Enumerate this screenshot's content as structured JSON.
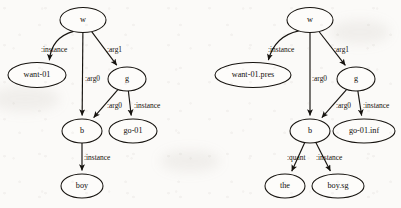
{
  "figure": {
    "type": "amr-graph-pair",
    "background_color": "#fbfaf8",
    "stroke_color": "#16130f",
    "node_fill": "#fdfcfa"
  },
  "graphs": [
    {
      "id": "left-graph",
      "name": "amr-graph-left",
      "nodes": [
        {
          "id": "w",
          "label": "w",
          "cx": 83,
          "cy": 20,
          "rx": 23,
          "ry": 12.5,
          "font_size": 8.2
        },
        {
          "id": "want",
          "label": "want-01",
          "cx": 37,
          "cy": 75,
          "rx": 29,
          "ry": 12.5,
          "font_size": 8.2
        },
        {
          "id": "g",
          "label": "g",
          "cx": 127,
          "cy": 79,
          "rx": 19,
          "ry": 12.0,
          "font_size": 8.2
        },
        {
          "id": "b",
          "label": "b",
          "cx": 82,
          "cy": 131,
          "rx": 20,
          "ry": 12.0,
          "font_size": 8.2
        },
        {
          "id": "go",
          "label": "go-01",
          "cx": 133,
          "cy": 131,
          "rx": 24,
          "ry": 12.0,
          "font_size": 8.2
        },
        {
          "id": "boy",
          "label": "boy",
          "cx": 82,
          "cy": 186,
          "rx": 21,
          "ry": 12.0,
          "font_size": 8.2
        }
      ],
      "edges": [
        {
          "id": "w-want",
          "from": "w",
          "to": "want",
          "label": ":instance",
          "label_x": 41,
          "label_y": 50,
          "curved": true
        },
        {
          "id": "w-b",
          "from": "w",
          "to": "b",
          "label": ":arg0",
          "label_x": 85,
          "label_y": 79,
          "curved": false
        },
        {
          "id": "w-g",
          "from": "w",
          "to": "g",
          "label": ":arg1",
          "label_x": 107,
          "label_y": 50,
          "curved": false
        },
        {
          "id": "g-b",
          "from": "g",
          "to": "b",
          "label": ":arg0",
          "label_x": 107,
          "label_y": 106,
          "curved": false
        },
        {
          "id": "g-go",
          "from": "g",
          "to": "go",
          "label": ":instance",
          "label_x": 134,
          "label_y": 106,
          "curved": false
        },
        {
          "id": "b-boy",
          "from": "b",
          "to": "boy",
          "label": ":instance",
          "label_x": 84,
          "label_y": 158,
          "curved": false
        }
      ]
    },
    {
      "id": "right-graph",
      "name": "amr-graph-right",
      "nodes": [
        {
          "id": "w2",
          "label": "w",
          "cx": 310,
          "cy": 20,
          "rx": 23,
          "ry": 12.5,
          "font_size": 8.2
        },
        {
          "id": "want2",
          "label": "want-01.pres",
          "cx": 253,
          "cy": 75,
          "rx": 38,
          "ry": 12.5,
          "font_size": 8.2
        },
        {
          "id": "g2",
          "label": "g",
          "cx": 356,
          "cy": 79,
          "rx": 19,
          "ry": 12.0,
          "font_size": 8.2
        },
        {
          "id": "b2",
          "label": "b",
          "cx": 310,
          "cy": 131,
          "rx": 20,
          "ry": 12.0,
          "font_size": 8.2
        },
        {
          "id": "go2",
          "label": "go-01.inf",
          "cx": 364,
          "cy": 131,
          "rx": 31,
          "ry": 12.0,
          "font_size": 8.2
        },
        {
          "id": "the",
          "label": "the",
          "cx": 285,
          "cy": 186,
          "rx": 20,
          "ry": 12.0,
          "font_size": 8.2
        },
        {
          "id": "boysg",
          "label": "boy.sg",
          "cx": 338,
          "cy": 186,
          "rx": 26,
          "ry": 12.0,
          "font_size": 8.2
        }
      ],
      "edges": [
        {
          "id": "w2-want2",
          "from": "w2",
          "to": "want2",
          "label": ":instance",
          "label_x": 268,
          "label_y": 50,
          "curved": true
        },
        {
          "id": "w2-b2",
          "from": "w2",
          "to": "b2",
          "label": ":arg0",
          "label_x": 312,
          "label_y": 79,
          "curved": false
        },
        {
          "id": "w2-g2",
          "from": "w2",
          "to": "g2",
          "label": ":arg1",
          "label_x": 334,
          "label_y": 50,
          "curved": false
        },
        {
          "id": "g2-b2",
          "from": "g2",
          "to": "b2",
          "label": ":arg0",
          "label_x": 336,
          "label_y": 106,
          "curved": false
        },
        {
          "id": "g2-go2",
          "from": "g2",
          "to": "go2",
          "label": ":instance",
          "label_x": 363,
          "label_y": 106,
          "curved": false
        },
        {
          "id": "b2-the",
          "from": "b2",
          "to": "the",
          "label": ":quant",
          "label_x": 287,
          "label_y": 158,
          "curved": false
        },
        {
          "id": "b2-boysg",
          "from": "b2",
          "to": "boysg",
          "label": ":instance",
          "label_x": 316,
          "label_y": 158,
          "curved": false
        }
      ]
    }
  ]
}
